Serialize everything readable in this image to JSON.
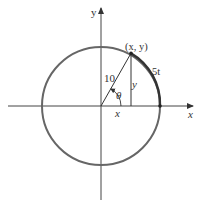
{
  "diagram": {
    "type": "unit-circle-parametric",
    "radius_label": "10",
    "point_label": "(x, y)",
    "arc_label": "5t",
    "angle_label": "θ",
    "horizontal_leg_label": "x",
    "vertical_leg_label": "y",
    "x_axis_label": "x",
    "y_axis_label": "y"
  },
  "colors": {
    "circle": "#555555",
    "arc_highlight": "#333333",
    "axis": "#444444",
    "text": "#333333"
  }
}
